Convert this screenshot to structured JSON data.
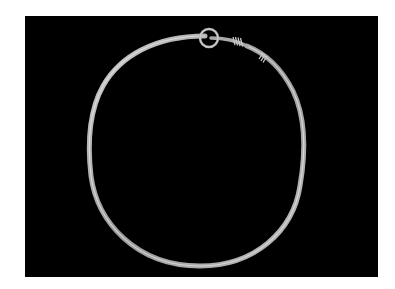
{
  "image": {
    "subject": "metal neck ring with loop clasp and wire wrappings",
    "background_color": "#000000",
    "frame_color": "#ffffff",
    "ring_color": "#b8b8b8",
    "ring_highlight": "#e0e0e0",
    "ring_shadow": "#6a6a6a"
  }
}
